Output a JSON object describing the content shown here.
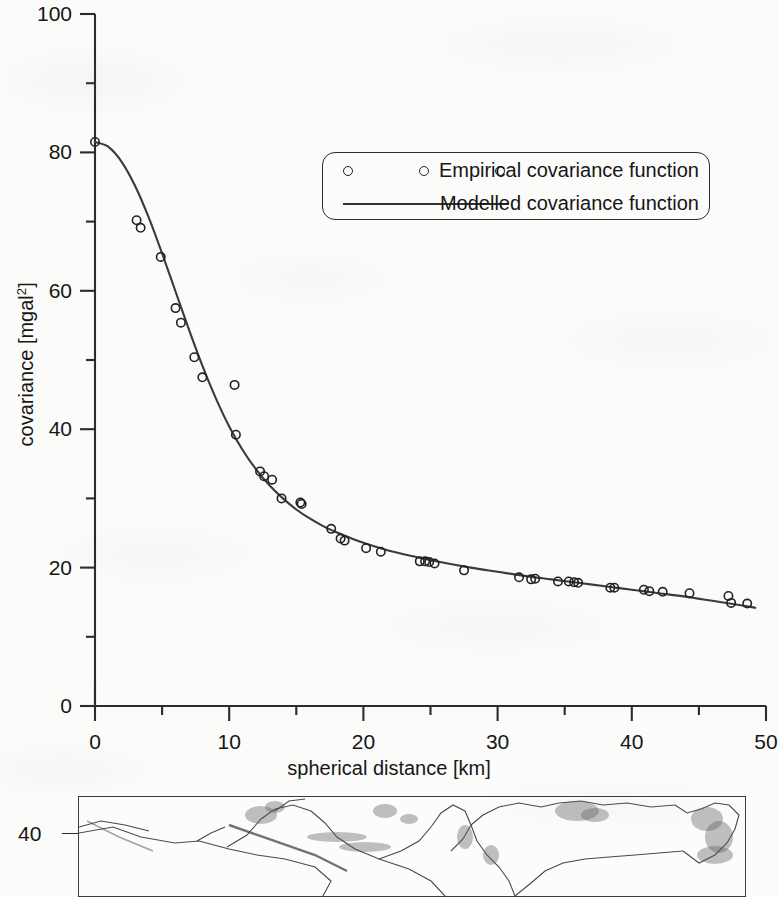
{
  "figure": {
    "y_axis_title_prefix": "covariance [mgal",
    "y_axis_title_sup": "2",
    "y_axis_title_suffix": "]",
    "x_axis_title": "spherical distance [km]"
  },
  "legend": {
    "position": "inside-top-right",
    "entries": [
      {
        "label": "Empirical covariance function",
        "marker": "open-circle",
        "marker_count": 3
      },
      {
        "label": "Modelled covariance function",
        "marker": "solid-line"
      }
    ]
  },
  "inset_map": {
    "lat_tick_label": "40",
    "description": "mediterranean-coastline-strip"
  },
  "colors": {
    "paper": "#fbfbf9",
    "ink": "#2b2b2b",
    "curve": "#3a3a3a",
    "marker_stroke": "#222222"
  },
  "chart_data": {
    "type": "scatter",
    "title": "",
    "xlabel": "spherical distance [km]",
    "ylabel": "covariance [mgal^2]",
    "xlim": [
      0,
      50
    ],
    "ylim": [
      0,
      100
    ],
    "xticks": [
      0,
      10,
      20,
      30,
      40,
      50
    ],
    "yticks": [
      0,
      20,
      40,
      60,
      80,
      100
    ],
    "xminor_step": 5,
    "yminor_step": 10,
    "grid": false,
    "series": [
      {
        "name": "Empirical covariance function",
        "type": "scatter",
        "marker": "open-circle",
        "points": [
          [
            0.0,
            81.5
          ],
          [
            3.1,
            70.2
          ],
          [
            3.4,
            69.1
          ],
          [
            4.9,
            64.9
          ],
          [
            6.0,
            57.5
          ],
          [
            6.4,
            55.4
          ],
          [
            7.4,
            50.4
          ],
          [
            8.0,
            47.5
          ],
          [
            10.4,
            46.4
          ],
          [
            10.5,
            39.2
          ],
          [
            12.3,
            33.9
          ],
          [
            12.6,
            33.2
          ],
          [
            13.2,
            32.7
          ],
          [
            13.9,
            30.0
          ],
          [
            15.3,
            29.4
          ],
          [
            15.4,
            29.2
          ],
          [
            17.6,
            25.6
          ],
          [
            18.3,
            24.2
          ],
          [
            18.6,
            23.9
          ],
          [
            20.2,
            22.8
          ],
          [
            21.3,
            22.3
          ],
          [
            24.2,
            20.9
          ],
          [
            24.6,
            20.9
          ],
          [
            24.9,
            20.8
          ],
          [
            25.3,
            20.6
          ],
          [
            27.5,
            19.6
          ],
          [
            31.6,
            18.6
          ],
          [
            32.5,
            18.3
          ],
          [
            32.8,
            18.4
          ],
          [
            34.5,
            18.0
          ],
          [
            35.3,
            18.0
          ],
          [
            35.7,
            17.9
          ],
          [
            36.0,
            17.8
          ],
          [
            38.4,
            17.1
          ],
          [
            38.7,
            17.1
          ],
          [
            40.9,
            16.8
          ],
          [
            41.3,
            16.6
          ],
          [
            42.3,
            16.5
          ],
          [
            44.3,
            16.3
          ],
          [
            47.2,
            15.9
          ],
          [
            47.4,
            14.9
          ],
          [
            48.6,
            14.8
          ]
        ]
      },
      {
        "name": "Modelled covariance function",
        "type": "line",
        "points": [
          [
            0.0,
            81.5
          ],
          [
            1.0,
            80.8
          ],
          [
            2.0,
            78.6
          ],
          [
            3.0,
            75.1
          ],
          [
            4.0,
            70.6
          ],
          [
            5.0,
            65.4
          ],
          [
            6.0,
            59.9
          ],
          [
            7.0,
            54.4
          ],
          [
            8.0,
            49.2
          ],
          [
            9.0,
            44.5
          ],
          [
            10.0,
            40.4
          ],
          [
            11.0,
            37.0
          ],
          [
            12.0,
            34.2
          ],
          [
            13.0,
            31.9
          ],
          [
            14.0,
            30.0
          ],
          [
            15.0,
            28.4
          ],
          [
            16.0,
            27.1
          ],
          [
            17.0,
            26.0
          ],
          [
            18.0,
            25.1
          ],
          [
            19.0,
            24.3
          ],
          [
            20.0,
            23.6
          ],
          [
            22.0,
            22.4
          ],
          [
            24.0,
            21.5
          ],
          [
            26.0,
            20.7
          ],
          [
            28.0,
            20.0
          ],
          [
            30.0,
            19.4
          ],
          [
            32.0,
            18.8
          ],
          [
            34.0,
            18.3
          ],
          [
            36.0,
            17.8
          ],
          [
            38.0,
            17.3
          ],
          [
            40.0,
            16.8
          ],
          [
            42.0,
            16.3
          ],
          [
            44.0,
            15.8
          ],
          [
            46.0,
            15.2
          ],
          [
            48.0,
            14.6
          ],
          [
            49.2,
            14.2
          ]
        ]
      }
    ]
  }
}
